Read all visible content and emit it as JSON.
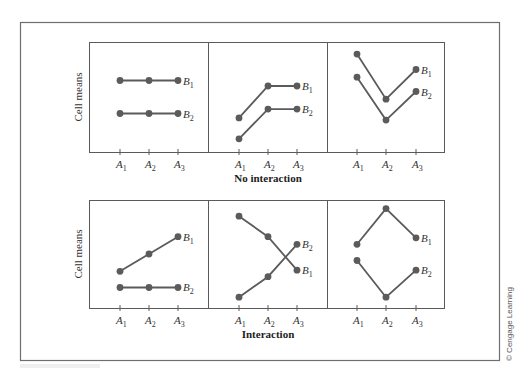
{
  "figure": {
    "y_axis_label": "Cell means",
    "credit": "© Cengage Learning",
    "colors": {
      "line": "#5b5b5b",
      "frame": "#6e6e6e",
      "text": "#333333"
    }
  },
  "chart_data": [
    {
      "type": "line",
      "row": 0,
      "col": 0,
      "row_title": "No interaction",
      "ylabel": "Cell means",
      "categories": [
        "A1",
        "A2",
        "A3"
      ],
      "ylim": [
        0,
        10
      ],
      "grid": false,
      "series": [
        {
          "name": "B1",
          "values": [
            6.5,
            6.5,
            6.5
          ]
        },
        {
          "name": "B2",
          "values": [
            3.5,
            3.5,
            3.5
          ]
        }
      ]
    },
    {
      "type": "line",
      "row": 0,
      "col": 1,
      "row_title": "No interaction",
      "categories": [
        "A1",
        "A2",
        "A3"
      ],
      "ylim": [
        0,
        10
      ],
      "grid": false,
      "series": [
        {
          "name": "B1",
          "values": [
            3.1,
            6.0,
            6.0
          ]
        },
        {
          "name": "B2",
          "values": [
            1.2,
            3.9,
            3.9
          ]
        }
      ]
    },
    {
      "type": "line",
      "row": 0,
      "col": 2,
      "row_title": "No interaction",
      "categories": [
        "A1",
        "A2",
        "A3"
      ],
      "ylim": [
        0,
        10
      ],
      "grid": false,
      "series": [
        {
          "name": "B1",
          "values": [
            8.9,
            4.8,
            7.5
          ]
        },
        {
          "name": "B2",
          "values": [
            6.8,
            2.9,
            5.5
          ]
        }
      ]
    },
    {
      "type": "line",
      "row": 1,
      "col": 0,
      "row_title": "Interaction",
      "ylabel": "Cell means",
      "categories": [
        "A1",
        "A2",
        "A3"
      ],
      "ylim": [
        0,
        10
      ],
      "grid": false,
      "series": [
        {
          "name": "B1",
          "values": [
            3.4,
            5.0,
            6.6
          ]
        },
        {
          "name": "B2",
          "values": [
            1.9,
            1.9,
            1.9
          ]
        }
      ]
    },
    {
      "type": "line",
      "row": 1,
      "col": 1,
      "row_title": "Interaction",
      "categories": [
        "A1",
        "A2",
        "A3"
      ],
      "ylim": [
        0,
        10
      ],
      "grid": false,
      "series": [
        {
          "name": "B1",
          "values": [
            8.5,
            6.6,
            3.5
          ]
        },
        {
          "name": "B2",
          "values": [
            1.0,
            2.9,
            5.9
          ]
        }
      ]
    },
    {
      "type": "line",
      "row": 1,
      "col": 2,
      "row_title": "Interaction",
      "categories": [
        "A1",
        "A2",
        "A3"
      ],
      "ylim": [
        0,
        10
      ],
      "grid": false,
      "series": [
        {
          "name": "B1",
          "values": [
            5.9,
            9.2,
            6.5
          ]
        },
        {
          "name": "B2",
          "values": [
            4.4,
            1.0,
            3.5
          ]
        }
      ]
    }
  ],
  "rows": [
    {
      "title": "No interaction"
    },
    {
      "title": "Interaction"
    }
  ]
}
